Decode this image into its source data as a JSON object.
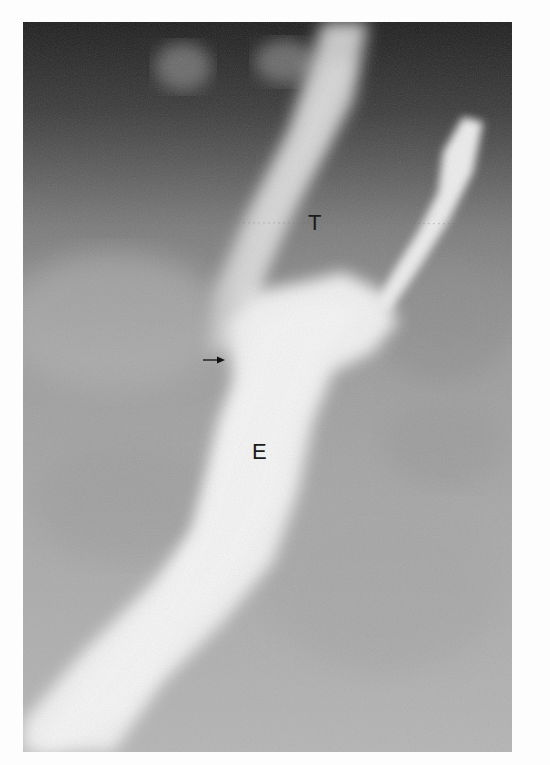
{
  "figure": {
    "type": "radiograph",
    "labels": [
      {
        "id": "trachea",
        "text": "T"
      },
      {
        "id": "esophagus",
        "text": "E"
      }
    ],
    "annotations": [
      {
        "id": "arrow",
        "icon": "arrow-right-icon",
        "direction": "right"
      }
    ]
  }
}
